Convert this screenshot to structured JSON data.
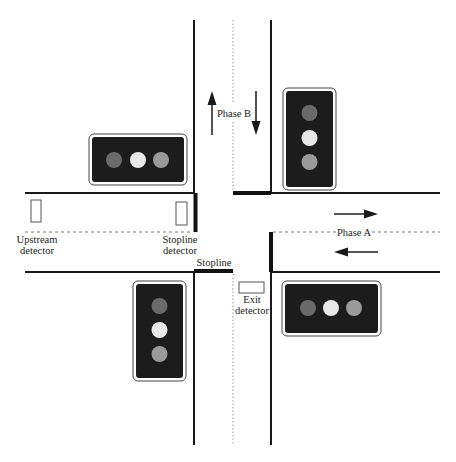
{
  "diagram": {
    "type": "signalized-intersection",
    "labels": {
      "phase_a": "Phase A",
      "phase_b": "Phase B",
      "upstream_detector_line1": "Upstream",
      "upstream_detector_line2": "detector",
      "stopline_detector_line1": "Stopline",
      "stopline_detector_line2": "detector",
      "stopline": "Stopline",
      "exit_detector_line1": "Exit",
      "exit_detector_line2": "detector"
    },
    "signals": [
      {
        "id": "northwest",
        "orientation": "horizontal",
        "lamps": [
          "dim",
          "lit",
          "mid"
        ]
      },
      {
        "id": "northeast",
        "orientation": "vertical",
        "lamps": [
          "dim",
          "lit",
          "mid"
        ]
      },
      {
        "id": "southwest",
        "orientation": "vertical",
        "lamps": [
          "dim",
          "lit",
          "mid"
        ]
      },
      {
        "id": "southeast",
        "orientation": "horizontal",
        "lamps": [
          "dim",
          "lit",
          "mid"
        ]
      }
    ],
    "colors": {
      "lamp_dim": "#6a6a6a",
      "lamp_lit": "#e8e8e8",
      "lamp_mid": "#9a9a9a",
      "signal_body": "#1c1c1c",
      "road_line": "#1a1a1a"
    }
  }
}
